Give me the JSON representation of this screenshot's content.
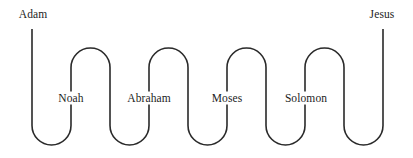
{
  "diagram": {
    "type": "serpentine-timeline",
    "title": "",
    "stroke_color": "#2a2a2a",
    "stroke_width": 1.6,
    "background_color": "#ffffff",
    "canvas": {
      "width": 413,
      "height": 158
    },
    "geometry": {
      "top_y": 29,
      "bottom_y": 145,
      "arch_top_y": 48,
      "label_y": 98,
      "radius": 19.5,
      "columns": [
        32,
        70,
        110,
        149,
        188,
        227,
        267,
        306,
        345,
        383
      ]
    },
    "nodes": [
      {
        "id": "adam",
        "label": "Adam",
        "x": 33,
        "y": 14,
        "position": "top-left",
        "anchor": "start"
      },
      {
        "id": "noah",
        "label": "Noah",
        "x": 71,
        "y": 98,
        "position": "middle",
        "anchor": "middle"
      },
      {
        "id": "abraham",
        "label": "Abraham",
        "x": 149,
        "y": 98,
        "position": "middle",
        "anchor": "middle"
      },
      {
        "id": "moses",
        "label": "Moses",
        "x": 227,
        "y": 98,
        "position": "middle",
        "anchor": "middle"
      },
      {
        "id": "solomon",
        "label": "Solomon",
        "x": 306,
        "y": 98,
        "position": "middle",
        "anchor": "middle"
      },
      {
        "id": "jesus",
        "label": "Jesus",
        "x": 382,
        "y": 14,
        "position": "top-right",
        "anchor": "end"
      }
    ],
    "path": "M 32 29 L 32 125.5 A 19.5 19.5 0 0 0 71 125.5 L 71 67.5 A 19.5 19.5 0 0 1 110 67.5 L 110 125.5 A 19.5 19.5 0 0 0 149 125.5 L 149 67.5 A 19.5 19.5 0 0 1 188 67.5 L 188 125.5 A 19.5 19.5 0 0 0 227 125.5 L 227 67.5 A 19.5 19.5 0 0 1 266 67.5 L 266 125.5 A 19.5 19.5 0 0 0 305 125.5 L 305 67.5 A 19.5 19.5 0 0 1 344 67.5 L 344 125.5 A 19.5 19.5 0 0 0 383 125.5 L 383 29"
  }
}
